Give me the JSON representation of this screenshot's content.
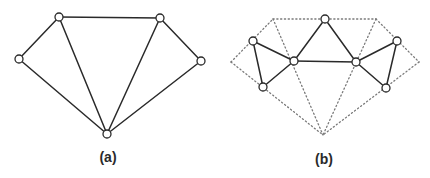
{
  "figure": {
    "panels": [
      {
        "id": "a",
        "label": "(a)",
        "label_pos": {
          "x": 108,
          "y": 149
        },
        "nodes": [
          {
            "id": "left",
            "x": 19,
            "y": 59
          },
          {
            "id": "top-left",
            "x": 59,
            "y": 17
          },
          {
            "id": "top-right",
            "x": 160,
            "y": 18
          },
          {
            "id": "right",
            "x": 201,
            "y": 61
          },
          {
            "id": "bottom",
            "x": 107,
            "y": 134
          }
        ],
        "solid_edges": [
          [
            "left",
            "top-left"
          ],
          [
            "top-left",
            "top-right"
          ],
          [
            "top-right",
            "right"
          ],
          [
            "left",
            "bottom"
          ],
          [
            "top-left",
            "bottom"
          ],
          [
            "top-right",
            "bottom"
          ],
          [
            "right",
            "bottom"
          ]
        ],
        "dotted_edges": []
      },
      {
        "id": "b",
        "label": "(b)",
        "label_pos": {
          "x": 324,
          "y": 151
        },
        "nodes": [
          {
            "id": "left-top",
            "x": 253,
            "y": 41
          },
          {
            "id": "left-bottom",
            "x": 263,
            "y": 87
          },
          {
            "id": "inner-left",
            "x": 294,
            "y": 61
          },
          {
            "id": "top",
            "x": 325,
            "y": 19
          },
          {
            "id": "inner-right",
            "x": 356,
            "y": 62
          },
          {
            "id": "right-top",
            "x": 397,
            "y": 41
          },
          {
            "id": "right-bottom",
            "x": 386,
            "y": 88
          }
        ],
        "solid_edges": [
          [
            "left-top",
            "left-bottom"
          ],
          [
            "left-top",
            "inner-left"
          ],
          [
            "left-bottom",
            "inner-left"
          ],
          [
            "inner-left",
            "top"
          ],
          [
            "top",
            "inner-right"
          ],
          [
            "inner-left",
            "inner-right"
          ],
          [
            "inner-right",
            "right-top"
          ],
          [
            "inner-right",
            "right-bottom"
          ],
          [
            "right-top",
            "right-bottom"
          ]
        ],
        "dotted_points": [
          {
            "id": "d-left",
            "x": 231,
            "y": 62
          },
          {
            "id": "d-top-left",
            "x": 273,
            "y": 19
          },
          {
            "id": "d-top-right",
            "x": 376,
            "y": 19
          },
          {
            "id": "d-right",
            "x": 419,
            "y": 62
          },
          {
            "id": "d-bottom",
            "x": 323,
            "y": 135
          }
        ],
        "dotted_edges": [
          [
            "d-left",
            "d-top-left"
          ],
          [
            "d-top-left",
            "d-top-right"
          ],
          [
            "d-top-right",
            "d-right"
          ],
          [
            "d-left",
            "d-bottom"
          ],
          [
            "d-top-left",
            "d-bottom"
          ],
          [
            "d-top-right",
            "d-bottom"
          ],
          [
            "d-right",
            "d-bottom"
          ]
        ]
      }
    ],
    "colors": {
      "line": "#2a2a2a",
      "dotted": "#7a7a7a",
      "node_fill": "#ffffff",
      "background": "#ffffff"
    },
    "node_radius": 4
  }
}
